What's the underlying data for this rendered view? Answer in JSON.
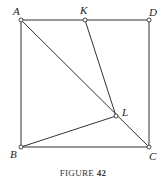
{
  "figure": {
    "caption_prefix": "FIGURE",
    "caption_number": "42",
    "points": {
      "A": {
        "label": "A",
        "x": 21,
        "y": 20
      },
      "K": {
        "label": "K",
        "x": 85,
        "y": 20
      },
      "D": {
        "label": "D",
        "x": 149,
        "y": 20
      },
      "B": {
        "label": "B",
        "x": 21,
        "y": 147
      },
      "C": {
        "label": "C",
        "x": 149,
        "y": 147
      },
      "L": {
        "label": "L",
        "x": 116,
        "y": 116
      }
    },
    "segments": [
      [
        "A",
        "K"
      ],
      [
        "K",
        "D"
      ],
      [
        "D",
        "C"
      ],
      [
        "C",
        "B"
      ],
      [
        "B",
        "A"
      ],
      [
        "A",
        "C"
      ],
      [
        "K",
        "L"
      ],
      [
        "B",
        "L"
      ]
    ],
    "colors": {
      "line": "#333333",
      "background": "#ffffff"
    }
  }
}
